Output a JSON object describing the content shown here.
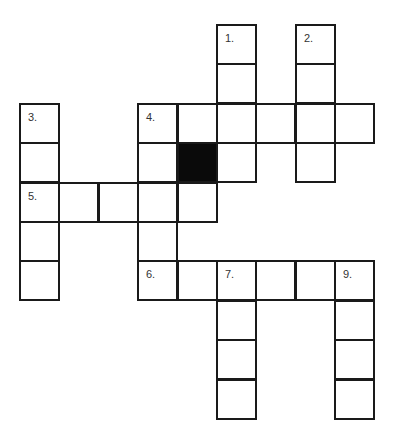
{
  "puzzle": {
    "type": "crossword",
    "cell_size": 39.4,
    "origin": {
      "x": 20,
      "y": 25
    },
    "cells": [
      {
        "r": 0,
        "c": 5,
        "num": "1."
      },
      {
        "r": 0,
        "c": 7,
        "num": "2."
      },
      {
        "r": 1,
        "c": 5
      },
      {
        "r": 1,
        "c": 7
      },
      {
        "r": 2,
        "c": 0,
        "num": "3."
      },
      {
        "r": 2,
        "c": 3,
        "num": "4."
      },
      {
        "r": 2,
        "c": 4
      },
      {
        "r": 2,
        "c": 5
      },
      {
        "r": 2,
        "c": 6
      },
      {
        "r": 2,
        "c": 7
      },
      {
        "r": 2,
        "c": 8
      },
      {
        "r": 3,
        "c": 0
      },
      {
        "r": 3,
        "c": 3
      },
      {
        "r": 3,
        "c": 4,
        "black": true
      },
      {
        "r": 3,
        "c": 5
      },
      {
        "r": 3,
        "c": 7
      },
      {
        "r": 4,
        "c": 0,
        "num": "5."
      },
      {
        "r": 4,
        "c": 1
      },
      {
        "r": 4,
        "c": 2
      },
      {
        "r": 4,
        "c": 3
      },
      {
        "r": 4,
        "c": 4
      },
      {
        "r": 5,
        "c": 0
      },
      {
        "r": 5,
        "c": 3
      },
      {
        "r": 6,
        "c": 0
      },
      {
        "r": 6,
        "c": 3,
        "num": "6."
      },
      {
        "r": 6,
        "c": 4
      },
      {
        "r": 6,
        "c": 5,
        "num": "7."
      },
      {
        "r": 6,
        "c": 6
      },
      {
        "r": 6,
        "c": 7
      },
      {
        "r": 6,
        "c": 8,
        "num": "9."
      },
      {
        "r": 7,
        "c": 5
      },
      {
        "r": 7,
        "c": 8
      },
      {
        "r": 8,
        "c": 5
      },
      {
        "r": 8,
        "c": 8
      },
      {
        "r": 9,
        "c": 5
      },
      {
        "r": 9,
        "c": 8
      }
    ]
  }
}
